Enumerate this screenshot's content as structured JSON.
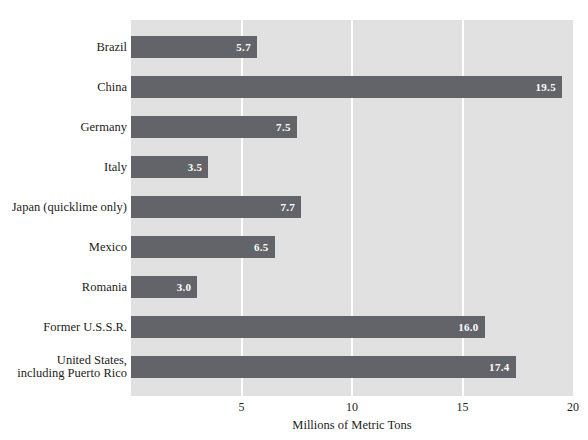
{
  "chart_data": {
    "type": "bar",
    "orientation": "horizontal",
    "title": "",
    "xlabel": "Millions of Metric Tons",
    "ylabel": "",
    "categories": [
      "Brazil",
      "China",
      "Germany",
      "Italy",
      "Japan (quicklime only)",
      "Mexico",
      "Romania",
      "Former U.S.S.R.",
      "United States, including Puerto Rico"
    ],
    "category_lines": [
      [
        "Brazil"
      ],
      [
        "China"
      ],
      [
        "Germany"
      ],
      [
        "Italy"
      ],
      [
        "Japan (quicklime only)"
      ],
      [
        "Mexico"
      ],
      [
        "Romania"
      ],
      [
        "Former U.S.S.R."
      ],
      [
        "United States,",
        "including Puerto Rico"
      ]
    ],
    "values": [
      5.7,
      19.5,
      7.5,
      3.5,
      7.7,
      6.5,
      3.0,
      16.0,
      17.4
    ],
    "value_labels": [
      "5.7",
      "19.5",
      "7.5",
      "3.5",
      "7.7",
      "6.5",
      "3.0",
      "16.0",
      "17.4"
    ],
    "xlim": [
      0,
      20
    ],
    "xticks": [
      5,
      10,
      15,
      20
    ],
    "xtick_labels": [
      "5",
      "10",
      "15",
      "20"
    ],
    "grid": true,
    "gridlines_at": [
      5,
      10,
      15
    ],
    "legend": null,
    "colors": {
      "bar": "#63636a",
      "plot_background": "#e1e1e1",
      "gridline": "#ffffff",
      "value_label": "#ffffff",
      "text": "#1d1d20",
      "figure_background": "#ffffff"
    }
  }
}
